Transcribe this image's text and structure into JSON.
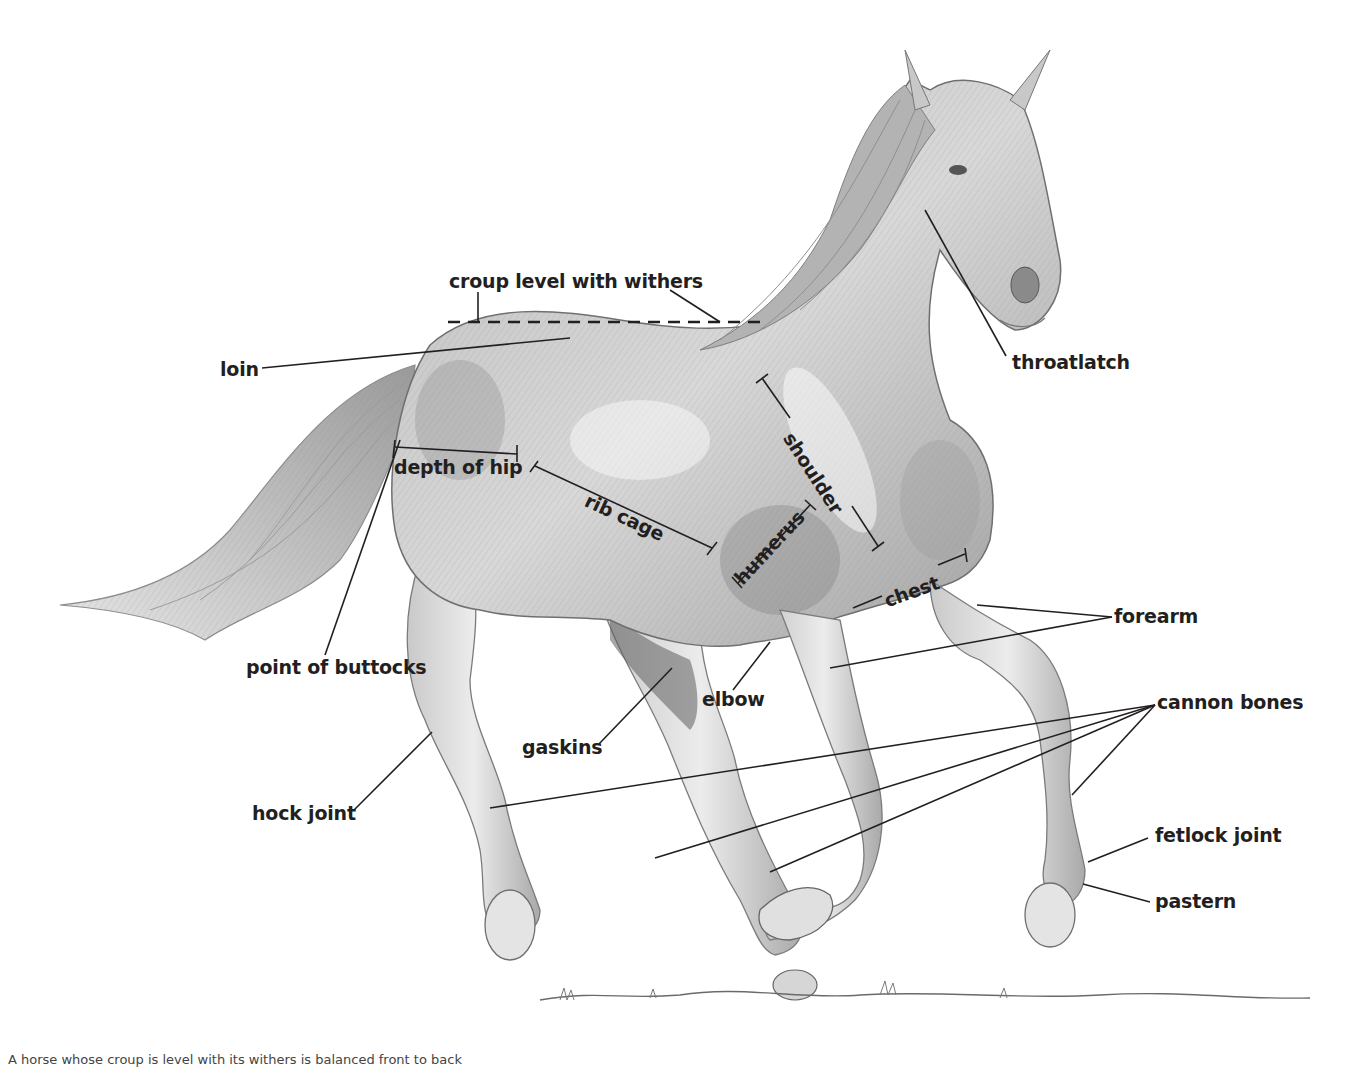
{
  "figure": {
    "colors": {
      "ink": "#231f20",
      "sketch_dark": "#6b6b6b",
      "sketch_mid": "#a8a8a8",
      "sketch_light": "#d9d9d9",
      "background": "#ffffff"
    }
  },
  "labels": {
    "croup": "croup level with withers",
    "loin": "loin",
    "throatlatch": "throatlatch",
    "shoulder": "shoulder",
    "depth_of_hip": "depth of hip",
    "rib_cage": "rib cage",
    "humerus": "humerus",
    "chest": "chest",
    "forearm": "forearm",
    "point_of_buttocks": "point of buttocks",
    "elbow": "elbow",
    "cannon_bones": "cannon bones",
    "gaskins": "gaskins",
    "hock_joint": "hock joint",
    "fetlock_joint": "fetlock joint",
    "pastern": "pastern"
  },
  "caption": "A horse whose croup is level with its withers is balanced front to back"
}
